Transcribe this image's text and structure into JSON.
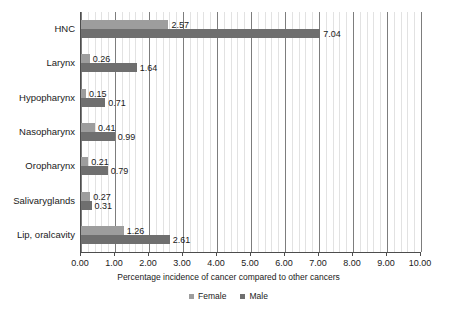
{
  "chart_data": {
    "type": "bar",
    "orientation": "horizontal",
    "title": "",
    "xlabel": "Percentage incidence of cancer compared to other cancers",
    "ylabel": "",
    "xlim": [
      0,
      10
    ],
    "xticks": [
      "0.00",
      "1.00",
      "2.00",
      "3.00",
      "4.00",
      "5.00",
      "6.00",
      "7.00",
      "8.00",
      "9.00",
      "10.00"
    ],
    "xtick_values": [
      0,
      1,
      2,
      3,
      4,
      5,
      6,
      7,
      8,
      9,
      10
    ],
    "minor_gridlines": true,
    "minor_grid_step": 0.2,
    "grid": true,
    "legend_position": "bottom-center",
    "categories": [
      "HNC",
      "Larynx",
      "Hypopharynx",
      "Nasopharynx",
      "Oropharynx",
      "Salivaryglands",
      "Lip, oralcavity"
    ],
    "series": [
      {
        "name": "Female",
        "color": "#9d9d9d",
        "values": [
          2.57,
          0.26,
          0.15,
          0.41,
          0.21,
          0.27,
          1.26
        ],
        "labels": [
          "2.57",
          "0.26",
          "0.15",
          "0.41",
          "0.21",
          "0.27",
          "1.26"
        ]
      },
      {
        "name": "Male",
        "color": "#6f6f6f",
        "values": [
          7.04,
          1.64,
          0.71,
          0.99,
          0.79,
          0.31,
          2.61
        ],
        "labels": [
          "7.04",
          "1.64",
          "0.71",
          "0.99",
          "0.79",
          "0.31",
          "2.61"
        ]
      }
    ]
  },
  "legend": {
    "items": [
      {
        "label": "Female",
        "swatch": "female-swatch"
      },
      {
        "label": "Male",
        "swatch": "male-swatch"
      }
    ]
  },
  "axis": {
    "x_title": "Percentage incidence of cancer compared to other cancers"
  }
}
